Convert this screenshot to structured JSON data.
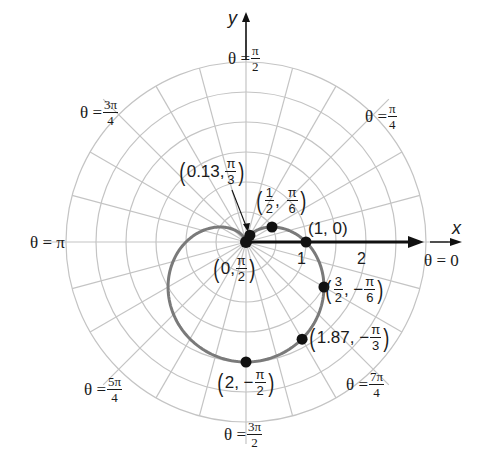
{
  "chart_data": {
    "type": "line",
    "coordinate_system": "polar",
    "title": "",
    "equation": "r = 1 - sin θ (cardioid)",
    "xlabel": "x",
    "ylabel": "y",
    "polar_axis_label": "θ = 0",
    "radial_ticks": [
      {
        "value": 1,
        "label": "1"
      },
      {
        "value": 2,
        "label": "2"
      }
    ],
    "grid": {
      "on": true,
      "ring_step": 0.5,
      "ring_max": 3,
      "spoke_step_degrees": 15
    },
    "angle_labels": [
      {
        "angle": "0",
        "text": "θ = 0"
      },
      {
        "angle": "π/4",
        "text": "θ = π/4"
      },
      {
        "angle": "π/2",
        "text": "θ = π/2"
      },
      {
        "angle": "3π/4",
        "text": "θ = 3π/4"
      },
      {
        "angle": "π",
        "text": "θ = π"
      },
      {
        "angle": "5π/4",
        "text": "θ = 5π/4"
      },
      {
        "angle": "3π/2",
        "text": "θ = 3π/2"
      },
      {
        "angle": "7π/4",
        "text": "θ = 7π/4"
      }
    ],
    "points": [
      {
        "r": 0,
        "theta": "π/2",
        "theta_rad": 1.5708,
        "label": "(0, π/2)"
      },
      {
        "r": 0.13,
        "theta": "π/3",
        "theta_rad": 1.0472,
        "label": "(0.13, π/3)"
      },
      {
        "r": 0.5,
        "theta": "π/6",
        "theta_rad": 0.5236,
        "label": "(1/2, π/6)"
      },
      {
        "r": 1,
        "theta": "0",
        "theta_rad": 0,
        "label": "(1, 0)"
      },
      {
        "r": 1.5,
        "theta": "-π/6",
        "theta_rad": -0.5236,
        "label": "(3/2, -π/6)"
      },
      {
        "r": 1.87,
        "theta": "-π/3",
        "theta_rad": -1.0472,
        "label": "(1.87, -π/3)"
      },
      {
        "r": 2,
        "theta": "-π/2",
        "theta_rad": -1.5708,
        "label": "(2, -π/2)"
      }
    ],
    "series": [
      {
        "name": "r = 1 - sin θ",
        "color": "#7a7a7a"
      }
    ],
    "legend": null
  },
  "labels": {
    "axis_x": "x",
    "axis_y": "y",
    "tick_1": "1",
    "tick_2": "2",
    "theta_eq": "θ =",
    "pi": "π",
    "theta_0": "θ = 0",
    "theta_pi": "θ = π",
    "a_pi2": {
      "num": "π",
      "den": "2"
    },
    "a_pi4": {
      "num": "π",
      "den": "4"
    },
    "a_3pi4": {
      "num": "3π",
      "den": "4"
    },
    "a_5pi4": {
      "num": "5π",
      "den": "4"
    },
    "a_3pi2": {
      "num": "3π",
      "den": "2"
    },
    "a_7pi4": {
      "num": "7π",
      "den": "4"
    }
  },
  "point_labels": {
    "p_013": {
      "r": "0.13,",
      "num": "π",
      "den": "3"
    },
    "p_half": {
      "rnum": "1",
      "rden": "2",
      "sep": ",",
      "num": "π",
      "den": "6"
    },
    "p_10": {
      "text": "(1, 0)"
    },
    "p_0": {
      "r": "0,",
      "num": "π",
      "den": "2"
    },
    "p_32": {
      "rnum": "3",
      "rden": "2",
      "sep": ", −",
      "num": "π",
      "den": "6"
    },
    "p_187": {
      "r": "1.87, −",
      "num": "π",
      "den": "3"
    },
    "p_2": {
      "r": "2, −",
      "num": "π",
      "den": "2"
    }
  },
  "colors": {
    "grid": "#c4c4c4",
    "curve": "#7a7a7a",
    "axis": "#111111",
    "point": "#111111"
  }
}
